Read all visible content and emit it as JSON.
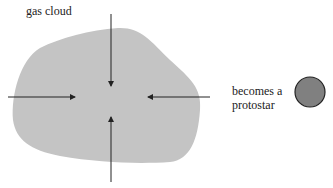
{
  "labels": {
    "gas_cloud": "gas cloud",
    "becomes_line1": "becomes a",
    "becomes_line2": "protostar"
  },
  "colors": {
    "cloud": "#c4c4c4",
    "protostar": "#808080",
    "arrow": "#222222"
  },
  "arrows": [
    {
      "direction": "down",
      "from": [
        111,
        14
      ],
      "to": [
        111,
        87
      ]
    },
    {
      "direction": "right",
      "from": [
        8,
        97
      ],
      "to": [
        76,
        97
      ]
    },
    {
      "direction": "left",
      "from": [
        210,
        97
      ],
      "to": [
        147,
        97
      ]
    },
    {
      "direction": "up",
      "from": [
        111,
        182
      ],
      "to": [
        111,
        116
      ]
    }
  ]
}
